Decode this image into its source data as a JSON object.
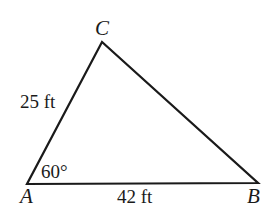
{
  "diagram": {
    "type": "triangle",
    "stroke_color": "#1a1a1a",
    "vertices": {
      "A": {
        "label": "A",
        "x": 27,
        "y": 184
      },
      "B": {
        "label": "B",
        "x": 258,
        "y": 183
      },
      "C": {
        "label": "C",
        "x": 102,
        "y": 42
      }
    },
    "sides": {
      "AC": {
        "label": "25 ft"
      },
      "AB": {
        "label": "42 ft"
      }
    },
    "angles": {
      "A": {
        "label": "60°"
      }
    }
  }
}
